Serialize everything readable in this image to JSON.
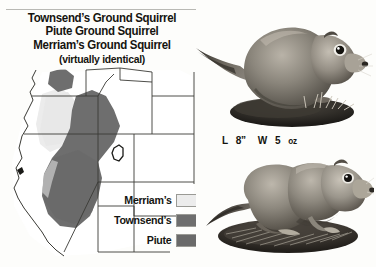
{
  "page": {
    "background_color": "#fdfdfb",
    "width": 376,
    "height": 267
  },
  "title": {
    "line1": "Townsend’s Ground Squirrel",
    "line2": "Piute Ground Squirrel",
    "line3": "Merriam’s Ground Squirrel",
    "line4": "(virtually identical)"
  },
  "measurement": {
    "length_label": "L",
    "length_value": "8”",
    "weight_label": "W",
    "weight_value": "5",
    "weight_unit": "oz",
    "full_text": "L 8”  W 5 oz"
  },
  "legend": {
    "items": [
      {
        "label": "Merriam’s",
        "color": "#ececec",
        "border": "#9a9a95"
      },
      {
        "label": "Townsend’s",
        "color": "#6e6e6e",
        "border": "#9a9a95"
      },
      {
        "label": "Piute",
        "color": "#6a6a6a",
        "border": "#9a9a95"
      }
    ]
  },
  "map": {
    "region": "Western United States",
    "outline_color": "#2b2b28",
    "land_color": "#ffffff",
    "ranges": [
      {
        "name": "Merriam’s range",
        "color": "#ececec"
      },
      {
        "name": "Townsend’s range",
        "color": "#6e6e6e"
      },
      {
        "name": "Piute range",
        "color": "#6a6a6a"
      }
    ],
    "markers": [
      {
        "name": "utah-enclave-outline"
      },
      {
        "name": "california-coast-marker"
      }
    ]
  },
  "photos": [
    {
      "name": "ground-squirrel-photo-upright",
      "caption": "Plump ground squirrel perched on a dirt mound, facing right",
      "tone": "#7a766e"
    },
    {
      "name": "ground-squirrel-photo-standing",
      "caption": "Ground squirrel standing on a rock with dry grass, facing right",
      "tone": "#827d74"
    }
  ]
}
